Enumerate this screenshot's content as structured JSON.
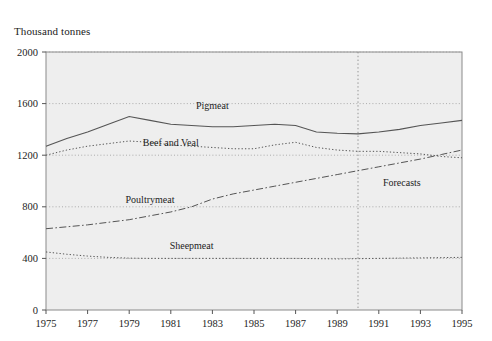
{
  "chart_data": {
    "type": "line",
    "title": "",
    "ylabel": "Thousand tonnes",
    "xlabel": "",
    "ylim": [
      0,
      2000
    ],
    "xlim": [
      1975,
      1995
    ],
    "yticks": [
      0,
      400,
      800,
      1200,
      1600,
      2000
    ],
    "xticks": [
      1975,
      1977,
      1979,
      1981,
      1983,
      1985,
      1987,
      1989,
      1991,
      1993,
      1995
    ],
    "grid": "horizontal-dotted",
    "legend": "inline-labels",
    "x": [
      1975,
      1976,
      1977,
      1978,
      1979,
      1980,
      1981,
      1982,
      1983,
      1984,
      1985,
      1986,
      1987,
      1988,
      1989,
      1990,
      1991,
      1992,
      1993,
      1994,
      1995
    ],
    "series": [
      {
        "name": "Pigmeat",
        "style": "solid",
        "label_x": 1983,
        "label_y": 1560,
        "values": [
          1270,
          1330,
          1380,
          1440,
          1500,
          1470,
          1440,
          1430,
          1420,
          1420,
          1430,
          1440,
          1430,
          1380,
          1370,
          1365,
          1380,
          1400,
          1430,
          1450,
          1470
        ]
      },
      {
        "name": "Beef and Veal",
        "style": "dotted",
        "label_x": 1981,
        "label_y": 1270,
        "values": [
          1200,
          1240,
          1270,
          1290,
          1310,
          1300,
          1280,
          1270,
          1260,
          1250,
          1250,
          1280,
          1300,
          1260,
          1240,
          1230,
          1230,
          1220,
          1210,
          1190,
          1180
        ]
      },
      {
        "name": "Poultrymeat",
        "style": "dashdot",
        "label_x": 1980,
        "label_y": 830,
        "values": [
          630,
          645,
          660,
          680,
          700,
          730,
          760,
          800,
          860,
          900,
          930,
          960,
          990,
          1020,
          1050,
          1080,
          1110,
          1140,
          1170,
          1205,
          1240
        ]
      },
      {
        "name": "Sheepmeat",
        "style": "dotted",
        "label_x": 1982,
        "label_y": 470,
        "values": [
          450,
          432,
          418,
          408,
          402,
          400,
          400,
          400,
          400,
          400,
          400,
          400,
          400,
          398,
          396,
          398,
          400,
          402,
          404,
          406,
          408
        ]
      }
    ],
    "annotations": [
      {
        "text": "Forecasts",
        "x": 1991.2,
        "y": 960
      }
    ],
    "markers": [
      {
        "type": "vertical-divider",
        "x": 1990,
        "style": "dotted"
      }
    ],
    "colors": {
      "plot_background": "#eeeeee",
      "plot_border": "#8a8a8a",
      "gridline": "#9a9a9a",
      "series_line": "#555555",
      "text": "#242424"
    }
  }
}
